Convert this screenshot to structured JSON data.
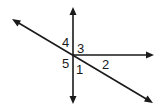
{
  "diagram": {
    "type": "intersecting-lines",
    "intersection": {
      "x": 73,
      "y": 55
    },
    "lines": [
      {
        "name": "vertical-line",
        "kind": "line",
        "from": {
          "x": 73,
          "y": 10
        },
        "to": {
          "x": 73,
          "y": 101
        }
      },
      {
        "name": "diagonal-line",
        "kind": "line",
        "from": {
          "x": 15,
          "y": 21
        },
        "to": {
          "x": 150,
          "y": 101
        }
      },
      {
        "name": "horizontal-ray",
        "kind": "ray",
        "from": {
          "x": 73,
          "y": 55
        },
        "to": {
          "x": 151,
          "y": 55
        }
      }
    ],
    "labels": [
      {
        "text": "4",
        "x": 62,
        "y": 47
      },
      {
        "text": "3",
        "x": 77,
        "y": 53
      },
      {
        "text": "5",
        "x": 62,
        "y": 68
      },
      {
        "text": "1",
        "x": 76,
        "y": 74
      },
      {
        "text": "2",
        "x": 102,
        "y": 69
      }
    ],
    "colors": {
      "stroke": "#1a1a1a",
      "background": "#ffffff"
    }
  }
}
